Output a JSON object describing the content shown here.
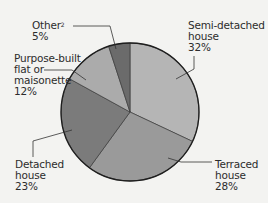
{
  "chart_data": {
    "type": "pie",
    "title": "",
    "start_angle_deg": 0,
    "direction": "clockwise",
    "slices": [
      {
        "label": "Semi-detached house",
        "value": 32,
        "display": "32%",
        "color": "#b5b5b5"
      },
      {
        "label": "Terraced house",
        "value": 28,
        "display": "28%",
        "color": "#9a9a9a"
      },
      {
        "label": "Detached house",
        "value": 23,
        "display": "23%",
        "color": "#7b7b7b"
      },
      {
        "label": "Purpose-built flat or maisonette",
        "value": 12,
        "display": "12%",
        "color": "#ababab"
      },
      {
        "label": "Other",
        "value": 5,
        "display": "5%",
        "color": "#6b6b6b",
        "footnote": "2"
      }
    ],
    "legend": "none (direct leader-line labels)"
  },
  "labels": {
    "other": {
      "line1": "Other",
      "sup": "2",
      "pct": "5%"
    },
    "purpose_built": {
      "line1": "Purpose-built",
      "line2": "flat or",
      "line3": "maisonette",
      "pct": "12%"
    },
    "semi": {
      "line1": "Semi-detached",
      "line2": "house",
      "pct": "32%"
    },
    "terraced": {
      "line1": "Terraced",
      "line2": "house",
      "pct": "28%"
    },
    "detached": {
      "line1": "Detached",
      "line2": "house",
      "pct": "23%"
    }
  },
  "geometry": {
    "cx": 130,
    "cy": 112,
    "r": 69
  }
}
